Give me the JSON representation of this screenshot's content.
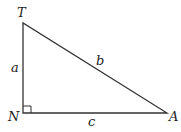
{
  "diagram": {
    "type": "right-triangle",
    "vertices": {
      "T": {
        "label": "T",
        "x": 23,
        "y": 23
      },
      "N": {
        "label": "N",
        "x": 23,
        "y": 113
      },
      "A": {
        "label": "A",
        "x": 167,
        "y": 113
      }
    },
    "sides": {
      "a": {
        "label": "a",
        "from": "T",
        "to": "N"
      },
      "b": {
        "label": "b",
        "from": "T",
        "to": "A"
      },
      "c": {
        "label": "c",
        "from": "N",
        "to": "A"
      }
    },
    "right_angle_at": "N",
    "colors": {
      "stroke": "#333333",
      "text": "#222222",
      "background": "#ffffff"
    }
  }
}
